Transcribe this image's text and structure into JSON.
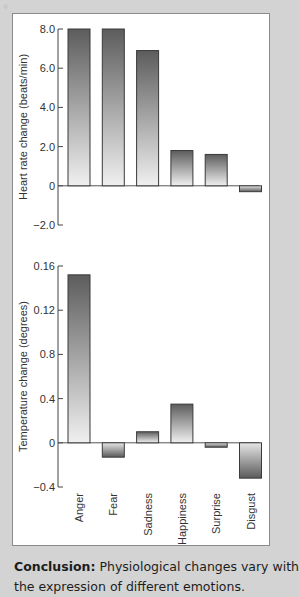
{
  "chart_data": [
    {
      "type": "bar",
      "title": "",
      "xlabel": "",
      "ylabel": "Heart rate change (beats/min)",
      "categories": [
        "Anger",
        "Fear",
        "Sadness",
        "Happiness",
        "Surprise",
        "Disgust"
      ],
      "values": [
        8.0,
        8.0,
        6.9,
        1.8,
        1.6,
        -0.3
      ],
      "ylim": [
        -2.0,
        8.0
      ],
      "yticks": [
        8.0,
        6.0,
        4.0,
        2.0,
        0,
        -2.0
      ],
      "ytick_labels": [
        "8.0",
        "6.0",
        "4.0",
        "2.0",
        "0",
        "-2.0"
      ],
      "grid": false,
      "legend": "none"
    },
    {
      "type": "bar",
      "title": "",
      "xlabel": "",
      "ylabel": "Temperature change (degrees)",
      "categories": [
        "Anger",
        "Fear",
        "Sadness",
        "Happiness",
        "Surprise",
        "Disgust"
      ],
      "values": [
        0.152,
        -0.013,
        0.01,
        0.035,
        -0.004,
        -0.032
      ],
      "ylim": [
        -0.04,
        0.16
      ],
      "yticks": [
        0.16,
        0.12,
        0.08,
        0.04,
        0,
        -0.04
      ],
      "ytick_labels": [
        "0.16",
        "0.12",
        "0.8",
        "0.4",
        "0",
        "-0.4"
      ],
      "ytick_note": "Labels as printed; uniform tick spacing indicates the middle labels are misprints of 0.08 and 0.04, and -0.4 of -0.04. Values are read against the assumed 0.04-step scale.",
      "grid": false,
      "legend": "none"
    }
  ],
  "conclusion": {
    "label": "Conclusion:",
    "text": " Physiological changes vary with",
    "text_line2": "the expression of different emotions."
  }
}
